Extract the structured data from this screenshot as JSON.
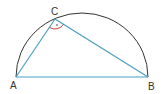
{
  "diagram": {
    "points": {
      "A": {
        "label": "A",
        "x": 16,
        "y": 77
      },
      "B": {
        "label": "B",
        "x": 148,
        "y": 77
      },
      "C": {
        "label": "C",
        "x": 55,
        "y": 19
      }
    },
    "colors": {
      "arc": "#333333",
      "triangle": "#4a9fc0",
      "angle_mark": "#d04040",
      "labels": "#333333"
    },
    "angle_mark_at": "C"
  }
}
